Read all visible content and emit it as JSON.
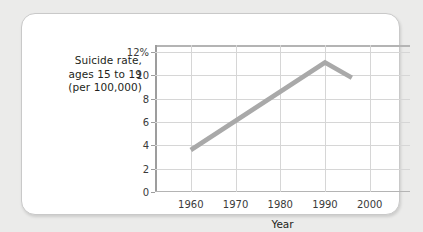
{
  "chart_data": {
    "type": "line",
    "title": "",
    "ylabel": "Suicide rate, ages 15 to 19 (per 100,000)",
    "ylabel_lines": [
      "Suicide rate,",
      "ages 15 to 19",
      "(per 100,000)"
    ],
    "xlabel": "Year",
    "xlim": [
      1952,
      2009
    ],
    "ylim": [
      0,
      12.6
    ],
    "grid": true,
    "legend": "none",
    "y_ticks": [
      0,
      2,
      4,
      6,
      8,
      10,
      12
    ],
    "y_tick_labels": [
      "0",
      "2",
      "4",
      "6",
      "8",
      "10",
      "12%"
    ],
    "x_ticks": [
      1960,
      1970,
      1980,
      1990,
      2000
    ],
    "x_tick_labels": [
      "1960",
      "1970",
      "1980",
      "1990",
      "2000"
    ],
    "series": [
      {
        "name": "Suicide rate, ages 15 to 19",
        "color": "#a9a9a9",
        "x": [
          1960,
          1990,
          1996
        ],
        "values": [
          3.6,
          11.1,
          9.8
        ]
      }
    ]
  },
  "colors": {
    "page_background": "#ebebea",
    "card_background": "#ffffff",
    "card_border": "#c9c9c9",
    "line": "#a9a9a9",
    "gridline": "#d6d6d6",
    "axis": "#9d9d9d",
    "text": "#231f20"
  }
}
